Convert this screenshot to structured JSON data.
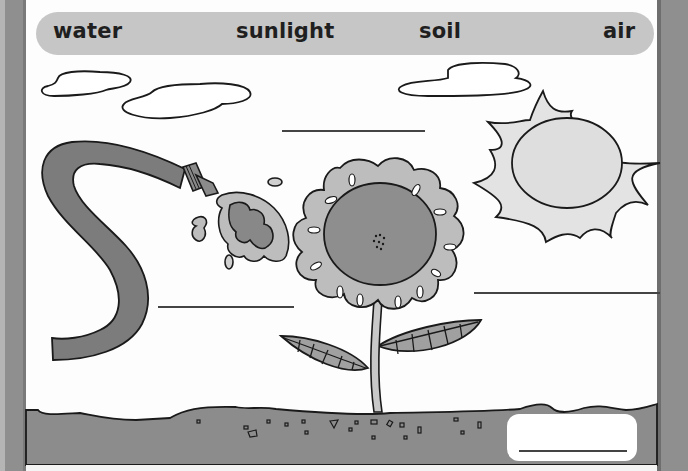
{
  "word_bank": {
    "words": [
      "water",
      "sunlight",
      "soil",
      "air"
    ]
  },
  "illustration": {
    "elements": [
      "cloud-icon",
      "cloud-icon",
      "cloud-icon",
      "sun-icon",
      "hose-icon",
      "water-splash-icon",
      "flower-icon",
      "leaf-icon",
      "leaf-icon",
      "soil-ground"
    ]
  },
  "answer_blanks": [
    {
      "label_for": "air",
      "value": ""
    },
    {
      "label_for": "water",
      "value": ""
    },
    {
      "label_for": "sunlight",
      "value": ""
    },
    {
      "label_for": "soil",
      "value": ""
    }
  ],
  "colors": {
    "border": "#8f8f8f",
    "word_bank_bg": "#c6c6c6",
    "soil": "#8c8c8c",
    "hose": "#7c7c7c",
    "petals": "#bdbdbd",
    "flower_center": "#8e8e8e",
    "sun": "#e3e3e3",
    "leaf": "#a0a0a0",
    "outline": "#1a1a1a"
  }
}
